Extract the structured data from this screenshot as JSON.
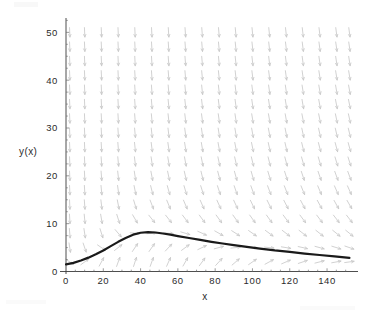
{
  "figure": {
    "kind": "direction-field-plot",
    "background_color": "#ffffff",
    "axis_color": "#3a3a3a",
    "field_color": "#c9c9c9",
    "curve_color": "#1a1a1a"
  },
  "chart_data": {
    "type": "line",
    "title": "",
    "subtitle": "",
    "xlabel": "x",
    "ylabel": "y(x)",
    "xlim": [
      0,
      155
    ],
    "ylim": [
      0,
      53
    ],
    "grid": false,
    "legend": null,
    "x_ticks": [
      0,
      20,
      40,
      60,
      80,
      100,
      120,
      140
    ],
    "x_tick_labels": [
      "0",
      "20",
      "40",
      "60",
      "80",
      "100",
      "120",
      "140"
    ],
    "y_ticks": [
      0,
      10,
      20,
      30,
      40,
      50
    ],
    "y_tick_labels": [
      "0",
      "10",
      "20",
      "30",
      "40",
      "50"
    ],
    "series": [
      {
        "name": "y(x)",
        "style": "solid-thick-black",
        "x": [
          0,
          4,
          8,
          12,
          16,
          20,
          24,
          28,
          32,
          36,
          40,
          44,
          48,
          52,
          56,
          60,
          66,
          72,
          78,
          84,
          90,
          96,
          104,
          112,
          120,
          128,
          136,
          144,
          152
        ],
        "y": [
          1.5,
          1.8,
          2.3,
          2.9,
          3.6,
          4.4,
          5.3,
          6.2,
          7.0,
          7.7,
          8.1,
          8.25,
          8.15,
          7.95,
          7.7,
          7.4,
          7.0,
          6.6,
          6.2,
          5.85,
          5.5,
          5.2,
          4.8,
          4.4,
          4.1,
          3.75,
          3.45,
          3.15,
          2.85
        ]
      }
    ],
    "annotations": [],
    "vector_field": {
      "description": "short gray slope-field segments; near-vertical downward strokes in upper region, bending to follow the solution curve near the bottom-left",
      "color": "#c9c9c9",
      "x_samples": [
        2,
        10,
        19,
        28,
        37,
        46,
        55,
        64,
        73,
        82,
        91,
        100,
        109,
        118,
        127,
        136,
        145,
        152
      ],
      "y_samples": [
        2,
        5,
        8,
        11,
        14,
        17,
        20,
        23,
        26,
        29,
        32,
        35,
        38,
        41,
        44,
        47,
        50
      ]
    }
  },
  "labels": {
    "y_axis_title": "y(x)",
    "x_axis_title": "x"
  }
}
